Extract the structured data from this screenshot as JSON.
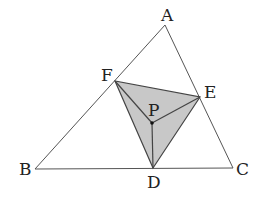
{
  "diagram": {
    "type": "geometry",
    "colors": {
      "stroke": "#555555",
      "shade_fill": "#c8c8c8",
      "point": "#111111",
      "background": "#ffffff"
    },
    "points": {
      "A": {
        "label": "A",
        "x": 165,
        "y": 25
      },
      "B": {
        "label": "B",
        "x": 35,
        "y": 169
      },
      "C": {
        "label": "C",
        "x": 233,
        "y": 168
      },
      "D": {
        "label": "D",
        "x": 153,
        "y": 168
      },
      "E": {
        "label": "E",
        "x": 200,
        "y": 97
      },
      "F": {
        "label": "F",
        "x": 115,
        "y": 81
      },
      "P": {
        "label": "P",
        "x": 152,
        "y": 123
      }
    },
    "labels": {
      "A": "A",
      "B": "B",
      "C": "C",
      "D": "D",
      "E": "E",
      "F": "F",
      "P": "P"
    },
    "segments": [
      [
        "A",
        "B"
      ],
      [
        "B",
        "C"
      ],
      [
        "C",
        "A"
      ],
      [
        "D",
        "E"
      ],
      [
        "E",
        "F"
      ],
      [
        "F",
        "D"
      ],
      [
        "P",
        "D"
      ],
      [
        "P",
        "E"
      ],
      [
        "P",
        "F"
      ]
    ],
    "shaded_polygon": [
      "D",
      "E",
      "F"
    ]
  }
}
